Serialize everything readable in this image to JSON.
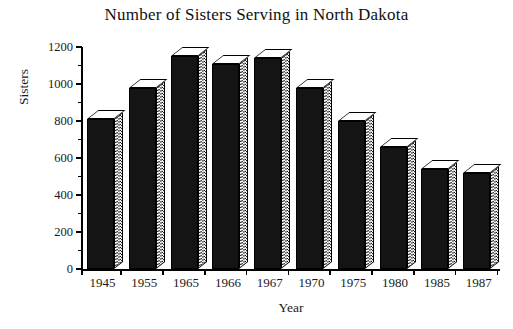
{
  "chart_data": {
    "type": "bar",
    "title": "Number of Sisters Serving in North Dakota",
    "xlabel": "Year",
    "ylabel": "Sisters",
    "categories": [
      "1945",
      "1955",
      "1965",
      "1966",
      "1967",
      "1970",
      "1975",
      "1980",
      "1985",
      "1987"
    ],
    "values": [
      810,
      980,
      1150,
      1110,
      1140,
      980,
      800,
      660,
      540,
      520
    ],
    "ylim": [
      0,
      1200
    ],
    "ytick_labels": [
      "0",
      "200",
      "400",
      "600",
      "800",
      "1000",
      "1200"
    ],
    "ytick_values": [
      0,
      200,
      400,
      600,
      800,
      1000,
      1200
    ],
    "yminor_step": 100,
    "grid": false,
    "legend": null,
    "style": {
      "bar_front_color": "#141414",
      "bar_side_color": "#b8b8b8",
      "bar_top_color": "#ffffff",
      "axis_color": "#000000",
      "background": "#ffffff"
    }
  }
}
